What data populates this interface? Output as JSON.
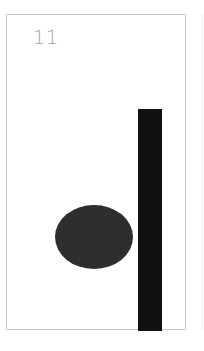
{
  "card": {
    "number": "11",
    "shapes": [
      {
        "type": "ellipse",
        "color": "#2e2e2e"
      },
      {
        "type": "vertical-bar",
        "color": "#111111"
      }
    ]
  },
  "colors": {
    "border": "#c9c9c9",
    "number_text": "#a3a3a3",
    "background": "#ffffff"
  }
}
